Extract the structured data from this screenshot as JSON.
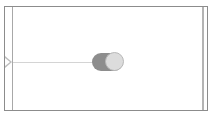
{
  "canvas": {
    "frame_color": "#8c8c8c",
    "background": "#ffffff"
  },
  "node": {
    "input_port": {
      "icon": "triangle-port-icon",
      "color": "#bdbdbd"
    },
    "connector": {
      "color": "#d4d4d4"
    },
    "toggle": {
      "state": "on",
      "track_color": "#8d8d8d",
      "knob_color": "#dcdcdc"
    }
  }
}
